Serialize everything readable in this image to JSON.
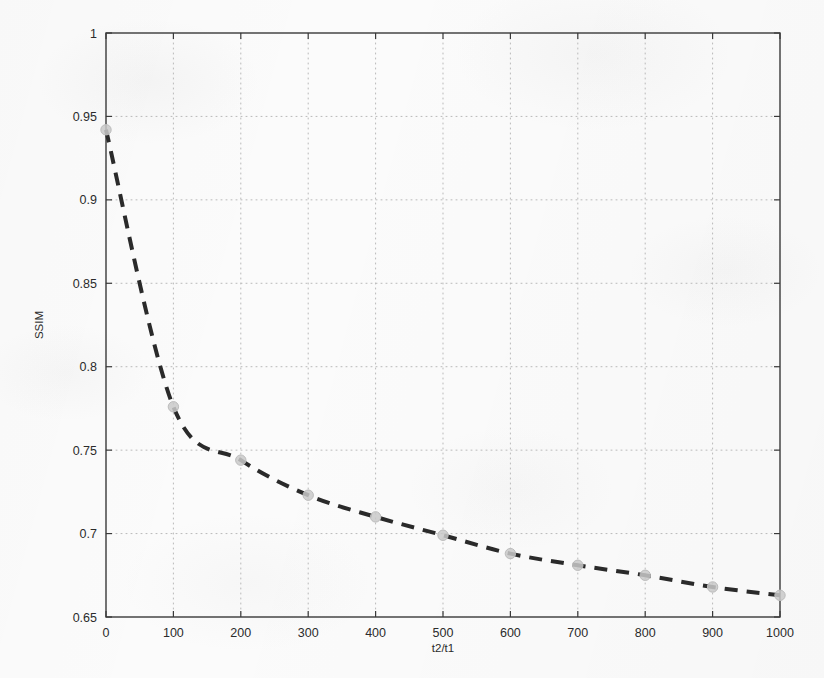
{
  "chart_data": {
    "type": "line",
    "title": "",
    "subtitle": "",
    "xlabel": "t2/t1",
    "ylabel": "SSIM",
    "xlim": [
      0,
      1000
    ],
    "ylim": [
      0.65,
      1
    ],
    "xticks": [
      0,
      100,
      200,
      300,
      400,
      500,
      600,
      700,
      800,
      900,
      1000
    ],
    "xtick_labels": [
      "0",
      "100",
      "200",
      "300",
      "400",
      "500",
      "600",
      "700",
      "800",
      "900",
      "1000"
    ],
    "yticks": [
      0.65,
      0.7,
      0.75,
      0.8,
      0.85,
      0.9,
      0.95,
      1
    ],
    "ytick_labels": [
      "0.65",
      "0.7",
      "0.75",
      "0.8",
      "0.85",
      "0.9",
      "0.95",
      "1"
    ],
    "grid": true,
    "grid_style": "dotted",
    "legend": null,
    "annotations": [],
    "series": [
      {
        "name": "SSIM vs t2/t1",
        "line_style": "dashed",
        "line_color": "#2a2a2a",
        "line_width": 4,
        "marker": "circle",
        "marker_color": "#c9c9c9",
        "x": [
          0,
          100,
          200,
          300,
          400,
          500,
          600,
          700,
          800,
          900,
          1000
        ],
        "values": [
          0.942,
          0.776,
          0.744,
          0.723,
          0.71,
          0.699,
          0.688,
          0.681,
          0.675,
          0.668,
          0.663
        ]
      }
    ]
  },
  "colors": {
    "background": "#fbfbfb",
    "axis": "#3a3a3a",
    "grid": "#b9b9b9",
    "curve": "#2a2a2a",
    "marker": "#c9c9c9",
    "text": "#2b2b2b"
  }
}
